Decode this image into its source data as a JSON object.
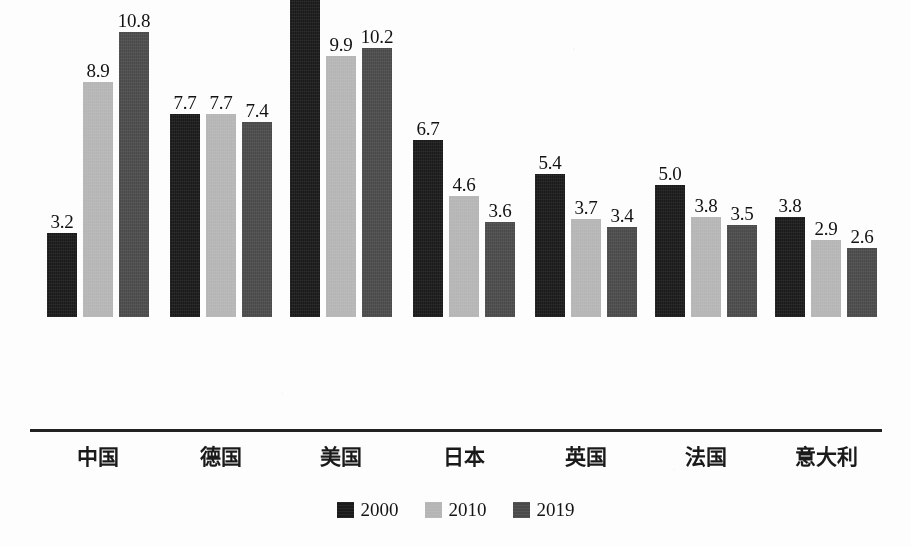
{
  "chart_data": {
    "type": "bar",
    "title": "",
    "subtitle": "",
    "xlabel": "",
    "ylabel": "",
    "ylim": [
      0,
      14.1
    ],
    "grid": false,
    "legend_position": "bottom-center",
    "axis_visible": "x-only",
    "categories": [
      "中国",
      "德国",
      "美国",
      "日本",
      "英国",
      "法国",
      "意大利"
    ],
    "series": [
      {
        "name": "2000",
        "color": "#1a1a1a",
        "values": [
          3.2,
          7.7,
          14.1,
          6.7,
          5.4,
          5.0,
          3.8
        ],
        "labels": [
          "3.2",
          "7.7",
          "14.1",
          "6.7",
          "5.4",
          "5.0",
          "3.8"
        ]
      },
      {
        "name": "2010",
        "color": "#b5b5b5",
        "values": [
          8.9,
          7.7,
          9.9,
          4.6,
          3.7,
          3.8,
          2.9
        ],
        "labels": [
          "8.9",
          "7.7",
          "9.9",
          "4.6",
          "3.7",
          "3.8",
          "2.9"
        ]
      },
      {
        "name": "2019",
        "color": "#4a4a4a",
        "values": [
          10.8,
          7.4,
          10.2,
          3.6,
          3.4,
          3.5,
          2.6
        ],
        "labels": [
          "10.8",
          "7.4",
          "10.2",
          "3.6",
          "3.4",
          "3.5",
          "2.6"
        ]
      }
    ]
  },
  "legend": {
    "items": [
      {
        "label": "2000",
        "series_index": 0
      },
      {
        "label": "2010",
        "series_index": 1
      },
      {
        "label": "2019",
        "series_index": 2
      }
    ]
  }
}
